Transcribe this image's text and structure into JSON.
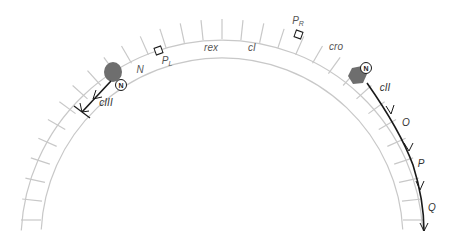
{
  "diagram": {
    "type": "lambda phage genetic map arc",
    "colors": {
      "ring": "#c8c8c8",
      "arrow": "#1a1a1a",
      "blob": "#6e6e6e",
      "label": "#555555"
    },
    "genes": {
      "N": "N",
      "rex": "rex",
      "cI": "cI",
      "cro": "cro",
      "cII": "cII",
      "cIII": "cIII",
      "O": "O",
      "P": "P",
      "Q": "Q"
    },
    "promoters": {
      "left": {
        "main": "P",
        "sub": "L"
      },
      "right": {
        "main": "P",
        "sub": "R"
      }
    },
    "proteins": {
      "left_marker": "N",
      "right_marker": "N"
    }
  }
}
